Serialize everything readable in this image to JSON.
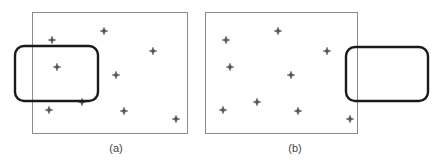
{
  "panels": [
    {
      "id": "a",
      "label": "(a)",
      "label_pos": [
        116,
        152
      ],
      "frame": {
        "x": 32,
        "y": 12,
        "w": 155,
        "h": 121
      },
      "points": [
        [
          52,
          40
        ],
        [
          104,
          31
        ],
        [
          153,
          51
        ],
        [
          57,
          67
        ],
        [
          116,
          75
        ],
        [
          49,
          110
        ],
        [
          82,
          102
        ],
        [
          124,
          111
        ],
        [
          176,
          119
        ]
      ],
      "window": {
        "x": 15,
        "y": 46,
        "w": 83,
        "h": 55,
        "r": 9
      }
    },
    {
      "id": "b",
      "label": "(b)",
      "label_pos": [
        295,
        152
      ],
      "frame": {
        "x": 205,
        "y": 12,
        "w": 152,
        "h": 121
      },
      "points": [
        [
          226,
          40
        ],
        [
          278,
          31
        ],
        [
          327,
          51
        ],
        [
          230,
          67
        ],
        [
          291,
          75
        ],
        [
          223,
          110
        ],
        [
          257,
          102
        ],
        [
          298,
          111
        ],
        [
          350,
          119
        ]
      ],
      "window": {
        "x": 346,
        "y": 47,
        "w": 82,
        "h": 54,
        "r": 9
      }
    }
  ],
  "colors": {
    "frame": "#8a8a8a",
    "window": "#1a1a1a",
    "point": "#555555"
  }
}
